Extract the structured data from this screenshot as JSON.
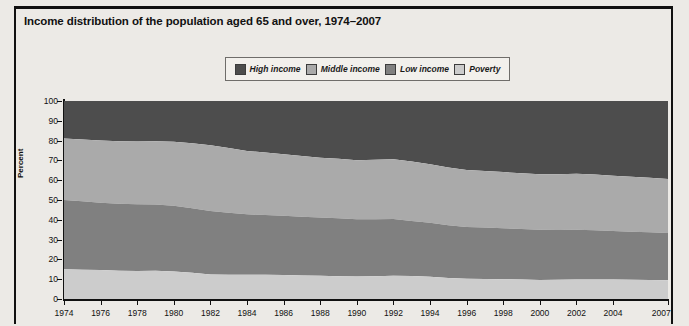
{
  "title": "Income distribution of the population aged 65 and over, 1974–2007",
  "colors": {
    "high_income": "#4d4d4d",
    "middle_income": "#aaaaaa",
    "low_income": "#808080",
    "poverty": "#cccccc",
    "page_background": "#eceae6",
    "plot_background": "#ffffff",
    "axis": "#111111"
  },
  "legend": {
    "position": "top-center",
    "items": [
      {
        "label": "High income",
        "color": "#4d4d4d"
      },
      {
        "label": "Middle income",
        "color": "#aaaaaa"
      },
      {
        "label": "Low income",
        "color": "#808080"
      },
      {
        "label": "Poverty",
        "color": "#cccccc"
      }
    ]
  },
  "chart_data": {
    "type": "area",
    "stacked": true,
    "title": "Income distribution of the population aged 65 and over, 1974–2007",
    "xlabel": "",
    "ylabel": "Percent",
    "ylim": [
      0,
      100
    ],
    "xlim": [
      1974,
      2007
    ],
    "grid": false,
    "ytick_labels": [
      "0",
      "10",
      "20",
      "30",
      "40",
      "50",
      "60",
      "70",
      "80",
      "90",
      "100"
    ],
    "ytick_values": [
      0,
      10,
      20,
      30,
      40,
      50,
      60,
      70,
      80,
      90,
      100
    ],
    "xtick_labels": [
      "1974",
      "1976",
      "1978",
      "1980",
      "1982",
      "1984",
      "1986",
      "1988",
      "1990",
      "1992",
      "1994",
      "1996",
      "1998",
      "2000",
      "2002",
      "2004",
      "2007"
    ],
    "xtick_values": [
      1974,
      1976,
      1978,
      1980,
      1982,
      1984,
      1986,
      1988,
      1990,
      1992,
      1994,
      1996,
      1998,
      2000,
      2002,
      2004,
      2007
    ],
    "x": [
      1974,
      1975,
      1976,
      1977,
      1978,
      1979,
      1980,
      1981,
      1982,
      1983,
      1984,
      1985,
      1986,
      1987,
      1988,
      1989,
      1990,
      1991,
      1992,
      1993,
      1994,
      1995,
      1996,
      1997,
      1998,
      1999,
      2000,
      2001,
      2002,
      2003,
      2004,
      2005,
      2006,
      2007
    ],
    "series": [
      {
        "name": "Poverty",
        "color": "#cccccc",
        "stack_order": 1,
        "values": [
          15.0,
          14.8,
          14.6,
          14.3,
          14.1,
          14.3,
          13.9,
          13.2,
          12.4,
          12.2,
          12.3,
          12.2,
          12.1,
          11.9,
          11.7,
          11.5,
          11.4,
          11.5,
          11.8,
          11.6,
          11.3,
          10.6,
          10.2,
          10.1,
          10.0,
          9.8,
          9.6,
          9.7,
          9.9,
          9.9,
          9.8,
          9.7,
          9.6,
          9.5
        ]
      },
      {
        "name": "Low income",
        "color": "#808080",
        "stack_order": 2,
        "values": [
          35.0,
          34.6,
          34.0,
          33.8,
          33.7,
          33.4,
          33.2,
          32.6,
          32.0,
          31.4,
          30.5,
          30.2,
          30.0,
          29.7,
          29.5,
          29.3,
          28.9,
          28.8,
          28.6,
          27.8,
          27.2,
          26.6,
          26.2,
          26.0,
          25.7,
          25.5,
          25.4,
          25.2,
          25.1,
          24.8,
          24.5,
          24.3,
          24.1,
          23.8
        ]
      },
      {
        "name": "Middle income",
        "color": "#aaaaaa",
        "stack_order": 3,
        "values": [
          31.0,
          31.2,
          31.4,
          31.6,
          31.8,
          32.0,
          32.3,
          32.8,
          33.2,
          32.6,
          32.0,
          31.6,
          31.0,
          30.6,
          30.2,
          30.0,
          29.8,
          30.0,
          30.2,
          30.0,
          29.6,
          29.2,
          28.8,
          28.6,
          28.4,
          28.2,
          28.0,
          28.1,
          28.3,
          28.2,
          28.0,
          27.8,
          27.6,
          27.3
        ]
      },
      {
        "name": "High income",
        "color": "#4d4d4d",
        "stack_order": 4,
        "values": [
          19.0,
          19.4,
          20.0,
          20.3,
          20.4,
          20.3,
          20.6,
          21.4,
          22.4,
          23.8,
          25.2,
          26.0,
          26.9,
          27.8,
          28.6,
          29.2,
          29.9,
          29.7,
          29.4,
          30.6,
          31.9,
          33.6,
          34.8,
          35.3,
          35.9,
          36.5,
          37.0,
          37.0,
          36.7,
          37.1,
          37.7,
          38.2,
          38.7,
          39.4
        ]
      }
    ],
    "cumulative_tops": {
      "poverty": [
        15.0,
        14.8,
        14.6,
        14.3,
        14.1,
        14.3,
        13.9,
        13.2,
        12.4,
        12.2,
        12.3,
        12.2,
        12.1,
        11.9,
        11.7,
        11.5,
        11.4,
        11.5,
        11.8,
        11.6,
        11.3,
        10.6,
        10.2,
        10.1,
        10.0,
        9.8,
        9.6,
        9.7,
        9.9,
        9.9,
        9.8,
        9.7,
        9.6,
        9.5
      ],
      "low_income": [
        50.0,
        49.4,
        48.6,
        48.1,
        47.8,
        47.7,
        47.1,
        45.8,
        44.4,
        43.6,
        42.8,
        42.4,
        42.1,
        41.6,
        41.2,
        40.8,
        40.3,
        40.3,
        40.4,
        39.4,
        38.5,
        37.2,
        36.4,
        36.1,
        35.7,
        35.3,
        35.0,
        34.9,
        35.0,
        34.7,
        34.3,
        34.0,
        33.7,
        33.3
      ],
      "middle_income": [
        81.0,
        80.6,
        80.0,
        79.7,
        79.6,
        79.7,
        79.4,
        78.6,
        77.6,
        76.2,
        74.8,
        74.0,
        73.1,
        72.2,
        71.4,
        70.8,
        70.1,
        70.3,
        70.6,
        69.4,
        68.1,
        66.4,
        65.2,
        64.7,
        64.1,
        63.5,
        63.0,
        63.0,
        63.3,
        62.9,
        62.3,
        61.8,
        61.3,
        60.6
      ],
      "high_income": [
        100,
        100,
        100,
        100,
        100,
        100,
        100,
        100,
        100,
        100,
        100,
        100,
        100,
        100,
        100,
        100,
        100,
        100,
        100,
        100,
        100,
        100,
        100,
        100,
        100,
        100,
        100,
        100,
        100,
        100,
        100,
        100,
        100,
        100
      ]
    }
  }
}
